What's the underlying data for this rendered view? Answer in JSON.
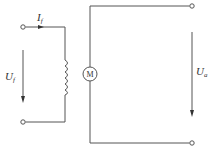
{
  "diagram": {
    "field_current": {
      "symbol": "I",
      "subscript": "f"
    },
    "field_voltage": {
      "symbol": "U",
      "subscript": "f"
    },
    "armature_voltage": {
      "symbol": "U",
      "subscript": "a"
    },
    "motor": {
      "label": "M"
    },
    "colors": {
      "line": "#555555",
      "text": "#333333",
      "background": "#ffffff"
    }
  }
}
